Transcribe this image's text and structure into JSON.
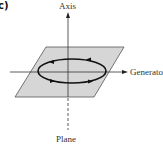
{
  "figure": {
    "panel_label": "c)",
    "labels": {
      "axis": "Axis",
      "generator": "Generato",
      "plane": "Plane"
    },
    "colors": {
      "plane_fill": "#d6d6d6",
      "plane_edge": "#555555",
      "line": "#333333",
      "loop": "#111111"
    },
    "elements": {
      "plane": "parallelogram",
      "axis": "vertical arrow (solid above plane, dashed below)",
      "generator": "horizontal arrow pointing right",
      "loop": "ellipse with four direction arrowheads"
    }
  }
}
